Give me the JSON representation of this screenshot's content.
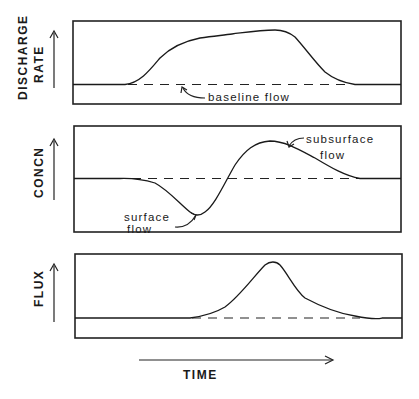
{
  "figure": {
    "panels": [
      {
        "id": "discharge",
        "ylabel_line1": "DISCHARGE",
        "ylabel_line2": "RATE",
        "annotation": "baseline flow"
      },
      {
        "id": "concentration",
        "ylabel_line1": "CONCN",
        "annotation_surface_line1": "surface",
        "annotation_surface_line2": "flow",
        "annotation_subsurface_line1": "subsurface",
        "annotation_subsurface_line2": "flow"
      },
      {
        "id": "flux",
        "ylabel_line1": "FLUX"
      }
    ],
    "xlabel": "TIME",
    "colors": {
      "ink": "#1a1a1a",
      "background": "#ffffff"
    }
  }
}
